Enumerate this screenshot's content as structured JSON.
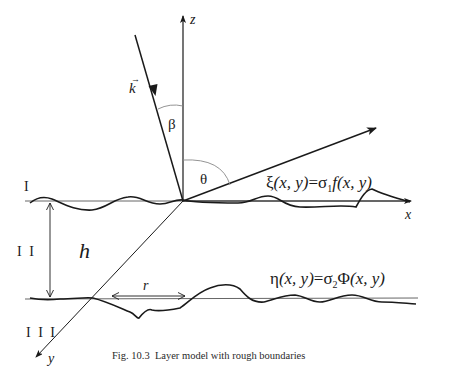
{
  "figure": {
    "caption": "Fig. 10.3  Layer model with rough boundaries",
    "axes": {
      "x_label": "x",
      "y_label": "y",
      "z_label": "z"
    },
    "vectors": {
      "incident_label": "k",
      "incident_arrow_glyph": "→"
    },
    "angles": {
      "beta": "β",
      "theta": "θ"
    },
    "layers": {
      "top": "I",
      "middle": "I I",
      "bottom": "I I I"
    },
    "dimensions": {
      "thickness": "h",
      "correlation_length": "r"
    },
    "equations": {
      "upper_boundary": {
        "lhs_fn": "ξ",
        "lhs_args": "(x, y)",
        "eq": "=",
        "sigma": "σ",
        "sigma_sub": "1",
        "rhs_fn": "f",
        "rhs_args": "(x, y)"
      },
      "lower_boundary": {
        "lhs_fn": "η",
        "lhs_args": "(x, y)",
        "eq": "=",
        "sigma": "σ",
        "sigma_sub": "2",
        "rhs_fn": "Φ",
        "rhs_args": "(x, y)"
      }
    },
    "colors": {
      "ink": "#1a1a1a",
      "thin_line": "#555555",
      "arc": "#888888",
      "background": "#ffffff"
    }
  }
}
